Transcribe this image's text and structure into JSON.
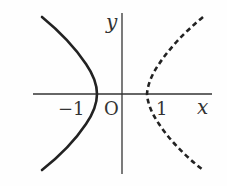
{
  "diagram": {
    "type": "hyperbola-graph",
    "axes": {
      "x_label": "x",
      "y_label": "y",
      "origin_label": "O",
      "tick_labels": [
        {
          "value": -1,
          "text": "−1"
        },
        {
          "value": 1,
          "text": "1"
        }
      ]
    },
    "curves": [
      {
        "name": "left-branch",
        "style": "solid",
        "vertex_x": -1
      },
      {
        "name": "right-branch",
        "style": "dashed",
        "vertex_x": 1
      }
    ],
    "colors": {
      "stroke": "#222222",
      "axis": "#333333",
      "background": "#fefefe"
    }
  }
}
